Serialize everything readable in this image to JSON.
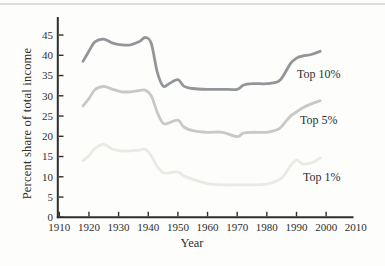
{
  "figure": {
    "ylabel": "Percent share of total income",
    "xlabel": "Year",
    "top_rule_color": "#dcdcda",
    "axis_color": "#2e2e2e",
    "background": "#fdfdfc"
  },
  "chart_data": {
    "type": "line",
    "title": "",
    "xlabel": "Year",
    "ylabel": "Percent share of total income",
    "xlim": [
      1910,
      2010
    ],
    "ylim": [
      0,
      47.5
    ],
    "x_ticks": [
      1910,
      1920,
      1930,
      1940,
      1950,
      1960,
      1970,
      1980,
      1990,
      2000,
      2010
    ],
    "y_ticks": [
      0,
      5,
      10,
      15,
      20,
      25,
      30,
      35,
      40,
      45
    ],
    "grid": false,
    "legend_position": "inline-right-of-lines",
    "x": [
      1918,
      1920,
      1922,
      1925,
      1928,
      1931,
      1934,
      1937,
      1939,
      1941,
      1943,
      1945,
      1947,
      1950,
      1952,
      1955,
      1960,
      1965,
      1970,
      1972,
      1975,
      1980,
      1984,
      1986,
      1988,
      1990,
      1992,
      1995,
      1998
    ],
    "series": [
      {
        "name": "Top 10%",
        "color": "#939699",
        "values": [
          38.5,
          41,
          43.3,
          44,
          43,
          42.6,
          42.6,
          43.4,
          44.4,
          43,
          36,
          32.4,
          33,
          34,
          32.4,
          31.8,
          31.6,
          31.6,
          31.6,
          32.6,
          33,
          33,
          33.6,
          35.5,
          38,
          39.3,
          39.8,
          40.2,
          41
        ]
      },
      {
        "name": "Top 5%",
        "color": "#c6c9c8",
        "values": [
          27.5,
          29.3,
          31.5,
          32.3,
          31.6,
          31,
          31,
          31.3,
          31.4,
          30,
          26,
          23.2,
          23.3,
          24,
          22.3,
          21.4,
          21,
          21,
          19.9,
          20.8,
          21,
          21,
          21.8,
          23.3,
          25,
          26,
          27,
          28,
          28.8
        ]
      },
      {
        "name": "Top 1%",
        "color": "#e9eae4",
        "values": [
          14,
          15.2,
          17,
          18,
          16.8,
          16.4,
          16.4,
          16.6,
          16.8,
          15.2,
          12.6,
          11,
          11,
          11.2,
          10.2,
          9.4,
          8.3,
          8,
          8,
          8,
          8,
          8.2,
          9.2,
          10.5,
          12.8,
          14.1,
          13.2,
          13.4,
          14.7
        ]
      }
    ]
  }
}
